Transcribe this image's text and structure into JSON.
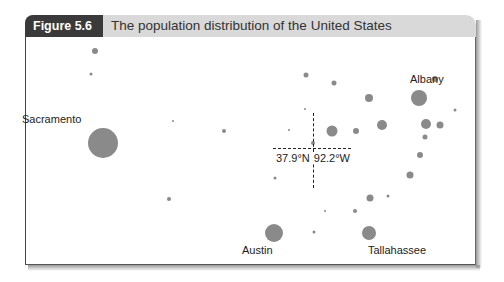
{
  "figure": {
    "label": "Figure 5.6",
    "title": "The population distribution of the United States"
  },
  "cities": [
    {
      "name": "Sacramento",
      "label_x": 22,
      "label_y": 113,
      "x": 103,
      "y": 143,
      "r": 15
    },
    {
      "name": "Albany",
      "label_x": 410,
      "label_y": 73,
      "x": 419,
      "y": 98,
      "r": 8
    },
    {
      "name": "Austin",
      "label_x": 242,
      "label_y": 244,
      "x": 274,
      "y": 233,
      "r": 9
    },
    {
      "name": "Tallahassee",
      "label_x": 368,
      "label_y": 244,
      "x": 369,
      "y": 233,
      "r": 7
    }
  ],
  "center": {
    "label": "37.9°N 92.2°W",
    "lat_label": "37.9°N",
    "lon_label": "92.2°W",
    "x": 313,
    "y": 149
  },
  "dots": [
    {
      "x": 95,
      "y": 51,
      "r": 3
    },
    {
      "x": 91,
      "y": 74,
      "r": 1.5
    },
    {
      "x": 173,
      "y": 121,
      "r": 1
    },
    {
      "x": 224,
      "y": 131,
      "r": 2
    },
    {
      "x": 306,
      "y": 75,
      "r": 2.5
    },
    {
      "x": 334,
      "y": 83,
      "r": 2.5
    },
    {
      "x": 369,
      "y": 98,
      "r": 4
    },
    {
      "x": 435,
      "y": 79,
      "r": 3
    },
    {
      "x": 455,
      "y": 110,
      "r": 1.5
    },
    {
      "x": 332,
      "y": 131,
      "r": 5.5
    },
    {
      "x": 356,
      "y": 131,
      "r": 3
    },
    {
      "x": 382,
      "y": 125,
      "r": 5
    },
    {
      "x": 426,
      "y": 124,
      "r": 5
    },
    {
      "x": 440,
      "y": 125,
      "r": 3.5
    },
    {
      "x": 425,
      "y": 137,
      "r": 2.5
    },
    {
      "x": 305,
      "y": 109,
      "r": 1
    },
    {
      "x": 289,
      "y": 130,
      "r": 1
    },
    {
      "x": 313,
      "y": 143,
      "r": 2
    },
    {
      "x": 420,
      "y": 155,
      "r": 3
    },
    {
      "x": 410,
      "y": 175,
      "r": 3.5
    },
    {
      "x": 275,
      "y": 178,
      "r": 1.5
    },
    {
      "x": 169,
      "y": 199,
      "r": 2
    },
    {
      "x": 370,
      "y": 198,
      "r": 3.5
    },
    {
      "x": 388,
      "y": 196,
      "r": 1.5
    },
    {
      "x": 325,
      "y": 211,
      "r": 1
    },
    {
      "x": 355,
      "y": 211,
      "r": 2
    },
    {
      "x": 314,
      "y": 232,
      "r": 1.5
    }
  ]
}
